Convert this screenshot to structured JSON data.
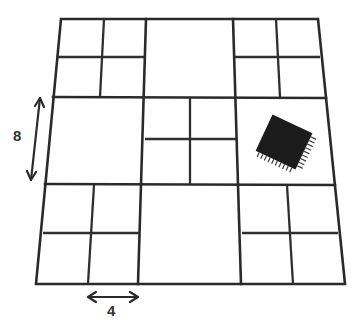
{
  "diagram": {
    "title": "",
    "grid": {
      "rows": 3,
      "cols": 3,
      "line_color": "#2a2a2a",
      "subdivided_cells": [
        {
          "row": 0,
          "col": 0
        },
        {
          "row": 0,
          "col": 2
        },
        {
          "row": 1,
          "col": 1
        },
        {
          "row": 2,
          "col": 0
        },
        {
          "row": 2,
          "col": 2
        }
      ],
      "empty_cells": [
        {
          "row": 0,
          "col": 1
        },
        {
          "row": 1,
          "col": 0
        },
        {
          "row": 1,
          "col": 2
        },
        {
          "row": 2,
          "col": 1
        }
      ]
    },
    "chip": {
      "icon": "ic-chip-icon",
      "cell": {
        "row": 1,
        "col": 2
      },
      "rotation_deg": 25,
      "color": "#1a1a1a"
    },
    "dimensions": {
      "vertical": {
        "label": "8",
        "spans": "one large cell height"
      },
      "horizontal": {
        "label": "4",
        "spans": "one sub-cell width"
      }
    }
  }
}
